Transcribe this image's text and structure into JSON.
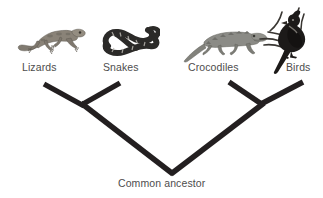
{
  "figure": {
    "type": "cladogram",
    "title": "",
    "background_color": "#ffffff",
    "branch_color": "#231f20",
    "label_color": "#4d4d4d"
  },
  "taxa": [
    {
      "id": "lizards",
      "label": "Lizards",
      "icon": "lizard-illustration",
      "icon_color": "#8a8378",
      "label_x": 22,
      "label_y": 61,
      "tip_x": 44,
      "tip_y": 84
    },
    {
      "id": "snakes",
      "label": "Snakes",
      "icon": "snake-illustration",
      "icon_color": "#2b2a28",
      "label_x": 103,
      "label_y": 61,
      "tip_x": 120,
      "tip_y": 83
    },
    {
      "id": "crocodiles",
      "label": "Crocodiles",
      "icon": "crocodile-illustration",
      "icon_color": "#8b8b86",
      "label_x": 188,
      "label_y": 61,
      "tip_x": 229,
      "tip_y": 82
    },
    {
      "id": "birds",
      "label": "Birds",
      "icon": "bird-illustration",
      "icon_color": "#1c1a19",
      "label_x": 286,
      "label_y": 61,
      "tip_x": 303,
      "tip_y": 82
    }
  ],
  "nodes": [
    {
      "id": "lizard-snake-node",
      "label": "",
      "x": 83,
      "y": 105
    },
    {
      "id": "croc-bird-node",
      "label": "",
      "x": 262,
      "y": 104
    },
    {
      "id": "root-node",
      "label": "Common ancestor",
      "x": 172,
      "y": 173,
      "label_x": 118,
      "label_y": 177
    }
  ],
  "branches": [
    {
      "id": "branch-lizards",
      "from": "lizards-tip",
      "to": "lizard-snake-node"
    },
    {
      "id": "branch-snakes",
      "from": "snakes-tip",
      "to": "lizard-snake-node"
    },
    {
      "id": "branch-crocodiles",
      "from": "crocodiles-tip",
      "to": "croc-bird-node"
    },
    {
      "id": "branch-birds",
      "from": "birds-tip",
      "to": "croc-bird-node"
    },
    {
      "id": "branch-left-stem",
      "from": "lizard-snake-node",
      "to": "root-node"
    },
    {
      "id": "branch-right-stem",
      "from": "croc-bird-node",
      "to": "root-node"
    }
  ]
}
